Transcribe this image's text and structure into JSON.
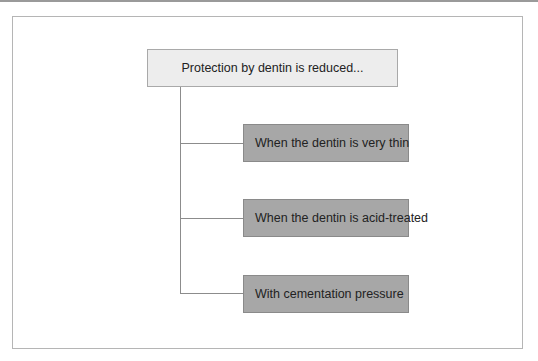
{
  "diagram": {
    "root": {
      "label": "Protection by dentin is reduced..."
    },
    "children": [
      {
        "label": "When the dentin is very thin"
      },
      {
        "label": "When the dentin is acid-treated"
      },
      {
        "label": "With cementation pressure"
      }
    ],
    "colors": {
      "root_fill": "#ededed",
      "child_fill": "#a7a7a7",
      "connector": "#8c8c8c",
      "frame": "#b5b5b5"
    }
  }
}
